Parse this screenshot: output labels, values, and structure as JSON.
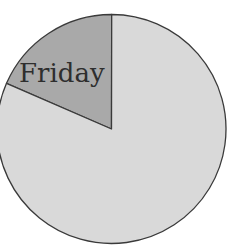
{
  "chart_data": {
    "type": "pie",
    "title": "",
    "slices": [
      {
        "label": "Friday",
        "value": 18.5,
        "color": "#a9a9a9",
        "labeled": true
      },
      {
        "label": "",
        "value": 81.5,
        "color": "#d9d9d9",
        "labeled": false
      }
    ],
    "start_angle_deg": 293.5,
    "direction": "clockwise",
    "legend": "none",
    "outline_color": "#3a3a3a"
  },
  "labels": {
    "friday": "Friday"
  }
}
